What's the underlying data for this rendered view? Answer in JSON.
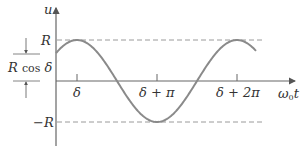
{
  "diagram": {
    "y_axis_label": "u",
    "x_axis_label_main": "ω",
    "x_axis_label_sub": "0",
    "x_axis_label_var": "t",
    "level_labels": {
      "top": "R",
      "bottom": "−R"
    },
    "dimension_label_R": "R",
    "dimension_label_cos": "cos",
    "dimension_label_delta": "δ",
    "x_ticks": [
      "δ",
      "δ + π",
      "δ + 2π"
    ],
    "colors": {
      "axis": "#666666",
      "curve": "#8a8a8a",
      "dashed": "#9a9a9a",
      "text": "#333333"
    }
  }
}
